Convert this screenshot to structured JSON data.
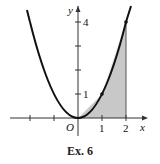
{
  "figure": {
    "caption": "Ex. 6",
    "axes": {
      "x_label": "x",
      "y_label": "y",
      "origin_label": "O",
      "x_tick_labels": [
        "1",
        "2"
      ],
      "y_tick_labels": [
        "1",
        "4"
      ]
    },
    "curve": "y = x^2",
    "polygon_points": [
      [
        0,
        0
      ],
      [
        1,
        1
      ],
      [
        2,
        4
      ]
    ],
    "shaded_interval": [
      0,
      2
    ],
    "colors": {
      "curve": "#111111",
      "shade": "#c8c8c8",
      "axes": "#333333"
    }
  }
}
